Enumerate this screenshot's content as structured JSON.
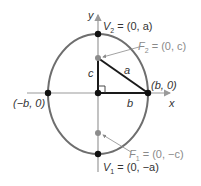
{
  "diagram": {
    "type": "ellipse-major-axis-vertical",
    "colors": {
      "ellipse": "#6e6e6e",
      "axes": "#9a9a9a",
      "triangle": "#1a1a1a",
      "vertex_point": "#111111",
      "focus_point": "#8c8c8c",
      "label_dark": "#333333",
      "label_gray": "#8a8a8a"
    },
    "axes": {
      "x_label": "x",
      "y_label": "y"
    },
    "points": {
      "v2": {
        "name": "V2",
        "label_main": "V",
        "label_sub": "2",
        "label_rest": " = (0, a)"
      },
      "v1": {
        "name": "V1",
        "label_main": "V",
        "label_sub": "1",
        "label_rest": " = (0, −a)"
      },
      "f2": {
        "name": "F2",
        "label_main": "F",
        "label_sub": "2",
        "label_rest": " = (0, c)"
      },
      "f1": {
        "name": "F1",
        "label_main": "F",
        "label_sub": "1",
        "label_rest": " = (0, −c)"
      },
      "right": {
        "label": "(b, 0)"
      },
      "left": {
        "label": "(−b, 0)"
      }
    },
    "triangle": {
      "side_vertical": "c",
      "side_horizontal": "b",
      "hypotenuse": "a"
    }
  }
}
